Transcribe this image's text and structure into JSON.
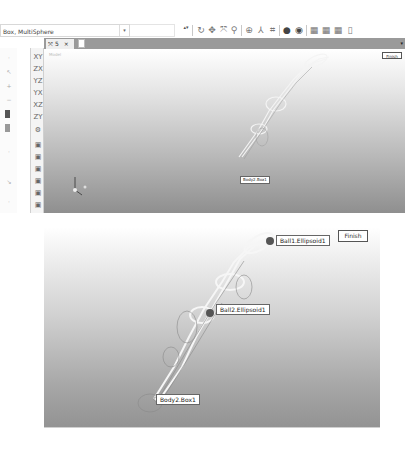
{
  "toolbar": {
    "selection_combo": "Box, MultiSphere",
    "combo_arrow": "▾",
    "spin": "▴▾",
    "icons": [
      "rotate-icon",
      "pan-icon",
      "fit-icon",
      "zoom-icon",
      "snap-icon",
      "axis-icon",
      "select-icon",
      "sphere-icon",
      "eye-icon",
      "view-front-icon",
      "view-top-icon",
      "view-side-icon"
    ]
  },
  "tabs": {
    "active_tab": "5",
    "close": "×",
    "menu": "▾"
  },
  "left_toolbar": {
    "icons": [
      "view-xy-icon",
      "view-zx-icon",
      "view-yz-icon",
      "view-yx-icon",
      "view-xz-icon",
      "view-zy-icon",
      "cog-icon",
      "cube-front-icon",
      "cube-back-icon",
      "cube-left-icon",
      "cube-right-icon",
      "cube-top-icon",
      "cube-bottom-icon"
    ],
    "glyphs": [
      "XY",
      "ZX",
      "YZ",
      "YX",
      "XZ",
      "ZY",
      "⚙",
      "▣",
      "▣",
      "▣",
      "▣",
      "▣",
      "▣"
    ]
  },
  "viewport_top": {
    "title": "Model",
    "finish_label": "Finish",
    "labels": [
      "Body2.Box1"
    ],
    "triad": {
      "x": "x",
      "y": "y",
      "z": "z"
    }
  },
  "viewport_bottom": {
    "finish_label": "Finish",
    "labels": [
      "Ball1.Ellipsoid1",
      "Ball2.Ellipsoid1",
      "Body2.Box1"
    ]
  }
}
